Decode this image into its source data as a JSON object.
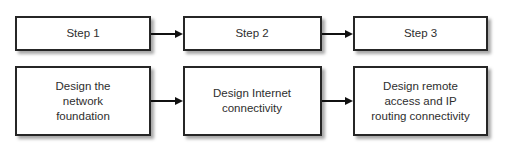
{
  "diagram": {
    "colors": {
      "background": "#ffffff",
      "box_fill": "#ffffff",
      "box_border": "#262626",
      "arrow": "#111111",
      "shadow_rgba": "rgba(0,0,0,0.35)",
      "text": "#2e2e2e"
    },
    "steps_row": {
      "boxes": [
        {
          "label": "Step 1"
        },
        {
          "label": "Step 2"
        },
        {
          "label": "Step 3"
        }
      ]
    },
    "tasks_row": {
      "boxes": [
        {
          "label": "Design the\nnetwork\nfoundation"
        },
        {
          "label": "Design Internet\nconnectivity"
        },
        {
          "label": "Design remote\naccess and IP\nrouting connectivity"
        }
      ]
    }
  }
}
